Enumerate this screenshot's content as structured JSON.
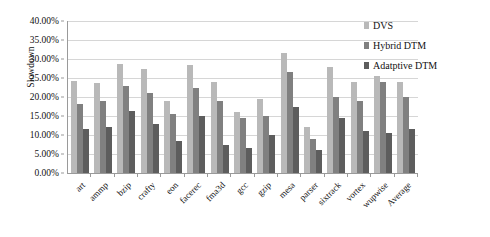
{
  "chart_data": {
    "type": "bar",
    "title": "",
    "xlabel": "",
    "ylabel": "Slowdown",
    "ylim": [
      0,
      0.4
    ],
    "grid": true,
    "legend_position": "top-right",
    "y_tick_labels": [
      "0.00%",
      "5.00%",
      "10.00%",
      "15.00%",
      "20.00%",
      "25.00%",
      "30.00%",
      "35.00%",
      "40.00%"
    ],
    "y_tick_values": [
      0,
      5,
      10,
      15,
      20,
      25,
      30,
      35,
      40
    ],
    "categories": [
      "art",
      "ammp",
      "bzip",
      "crafty",
      "eon",
      "facerec",
      "fma3d",
      "gcc",
      "gzip",
      "mesa",
      "parser",
      "sixtrack",
      "vortex",
      "wupwise",
      "Average"
    ],
    "series": [
      {
        "name": "DVS",
        "color": "#b9b9b9",
        "values": [
          24.1,
          23.6,
          28.6,
          27.4,
          19.0,
          28.5,
          24.0,
          16.0,
          19.5,
          31.5,
          12.0,
          28.0,
          24.0,
          25.5,
          24.0
        ]
      },
      {
        "name": "Hybrid DTM",
        "color": "#808080",
        "values": [
          18.1,
          19.0,
          23.0,
          21.0,
          15.5,
          22.5,
          19.0,
          14.5,
          15.0,
          26.5,
          9.0,
          20.0,
          19.0,
          24.0,
          20.0
        ]
      },
      {
        "name": "Adatptive DTM",
        "color": "#5d5d5d",
        "values": [
          11.5,
          12.0,
          16.3,
          13.0,
          8.5,
          15.0,
          7.5,
          6.5,
          10.0,
          17.5,
          6.0,
          14.5,
          11.0,
          10.5,
          11.5
        ]
      }
    ]
  }
}
